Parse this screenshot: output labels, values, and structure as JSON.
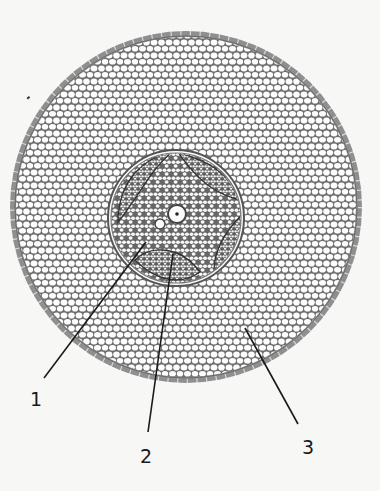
{
  "diagram": {
    "colors": {
      "background": "#f7f7f5",
      "cell_wall": "#6e6e6e",
      "epidermis_fill": "#9a9a9a",
      "cell_fill": "#fdfdfd",
      "line": "#1a1a1a"
    },
    "labels": [
      {
        "id": "1",
        "text": "1",
        "x": 30,
        "y": 388
      },
      {
        "id": "2",
        "text": "2",
        "x": 140,
        "y": 445
      },
      {
        "id": "3",
        "text": "3",
        "x": 302,
        "y": 436
      }
    ],
    "leader_lines": [
      {
        "for": "1",
        "x1": 146,
        "y1": 242,
        "x2": 44,
        "y2": 378
      },
      {
        "for": "2",
        "x1": 173,
        "y1": 254,
        "x2": 148,
        "y2": 432
      },
      {
        "for": "3",
        "x1": 245,
        "y1": 328,
        "x2": 298,
        "y2": 424
      }
    ]
  }
}
